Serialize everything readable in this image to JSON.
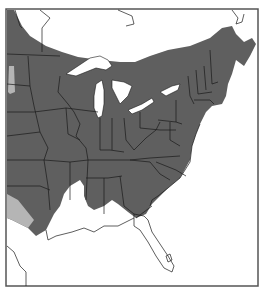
{
  "map": {
    "type": "species-range-map",
    "region": "Eastern United States and southeastern Canada",
    "colors": {
      "range": "#5f5f5f",
      "peripheral_range": "#b5b5b5",
      "land_outside_range": "#ffffff",
      "water": "#ffffff",
      "borders": "#1a1a1a",
      "frame": "#555555"
    },
    "legend": [],
    "labels": []
  }
}
